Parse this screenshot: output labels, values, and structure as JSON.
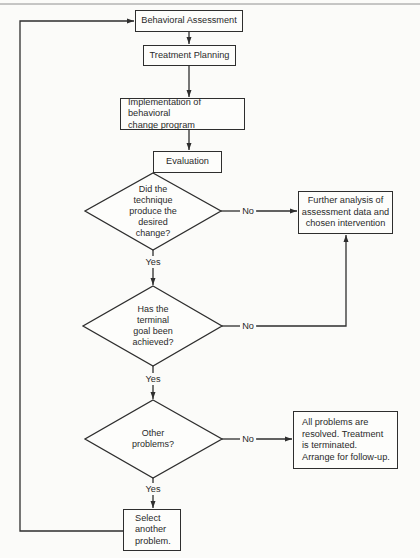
{
  "diagram": {
    "type": "flowchart",
    "nodes": {
      "assessment": {
        "kind": "process",
        "label": "Behavioral Assessment"
      },
      "planning": {
        "kind": "process",
        "label": "Treatment Planning"
      },
      "implementation": {
        "kind": "process",
        "label": "Implementation of behavioral\nchange program"
      },
      "evaluation": {
        "kind": "process",
        "label": "Evaluation"
      },
      "decision_change": {
        "kind": "decision",
        "label": "Did the\ntechnique\nproduce the\ndesired\nchange?"
      },
      "further_analysis": {
        "kind": "process",
        "label": "Further analysis of\nassessment data and\nchosen intervention"
      },
      "decision_goal": {
        "kind": "decision",
        "label": "Has the\nterminal\ngoal been\nachieved?"
      },
      "decision_other": {
        "kind": "decision",
        "label": "Other\nproblems?"
      },
      "resolved": {
        "kind": "terminal",
        "label": "All problems are\nresolved. Treatment\nis terminated.\nArrange for follow-up."
      },
      "select_another": {
        "kind": "process",
        "label": "Select\nanother\nproblem."
      }
    },
    "edge_labels": {
      "change_no": "No",
      "change_yes": "Yes",
      "goal_no": "No",
      "goal_yes": "Yes",
      "other_no": "No",
      "other_yes": "Yes"
    },
    "edges": [
      {
        "from": "assessment",
        "to": "planning",
        "label": ""
      },
      {
        "from": "planning",
        "to": "implementation",
        "label": ""
      },
      {
        "from": "implementation",
        "to": "evaluation",
        "label": ""
      },
      {
        "from": "evaluation",
        "to": "decision_change",
        "label": ""
      },
      {
        "from": "decision_change",
        "to": "further_analysis",
        "label": "No"
      },
      {
        "from": "decision_change",
        "to": "decision_goal",
        "label": "Yes"
      },
      {
        "from": "decision_goal",
        "to": "further_analysis",
        "label": "No"
      },
      {
        "from": "decision_goal",
        "to": "decision_other",
        "label": "Yes"
      },
      {
        "from": "decision_other",
        "to": "resolved",
        "label": "No"
      },
      {
        "from": "decision_other",
        "to": "select_another",
        "label": "Yes"
      },
      {
        "from": "select_another",
        "to": "assessment",
        "label": ""
      }
    ],
    "colors": {
      "line": "#2e2e2e",
      "background": "#fbfbf9",
      "text": "#2a2a2a"
    }
  }
}
